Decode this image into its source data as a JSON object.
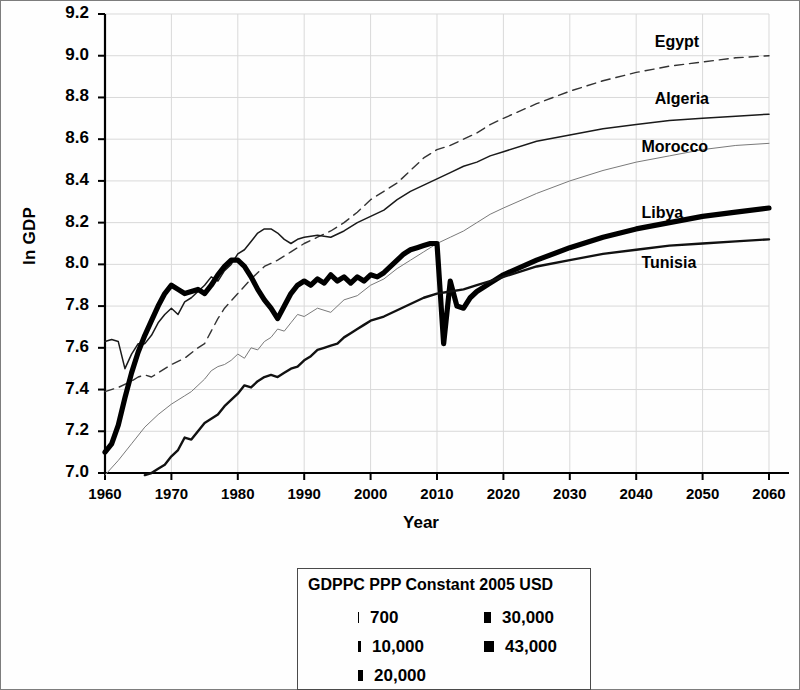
{
  "chart_data": {
    "type": "line",
    "title": "",
    "xlabel": "Year",
    "ylabel": "ln GDP",
    "xlim": [
      1960,
      2060
    ],
    "ylim": [
      7.0,
      9.2
    ],
    "xticks": [
      1960,
      1970,
      1980,
      1990,
      2000,
      2010,
      2020,
      2030,
      2040,
      2050,
      2060
    ],
    "yticks": [
      "7.0",
      "7.2",
      "7.4",
      "7.6",
      "7.8",
      "8.0",
      "8.2",
      "8.4",
      "8.6",
      "8.8",
      "9.0",
      "9.2"
    ],
    "grid": true,
    "legend_position": "below-plot",
    "series": [
      {
        "name": "Egypt",
        "style": "dashed",
        "width": 1.4,
        "color": "#333333",
        "label_x": 2044,
        "label_y": 9.06,
        "x": [
          1960,
          1962,
          1964,
          1965,
          1966,
          1967,
          1968,
          1970,
          1972,
          1974,
          1975,
          1976,
          1977,
          1978,
          1980,
          1982,
          1984,
          1986,
          1988,
          1990,
          1992,
          1994,
          1996,
          1998,
          2000,
          2002,
          2004,
          2006,
          2008,
          2010,
          2012,
          2014,
          2016,
          2018,
          2020,
          2025,
          2030,
          2035,
          2040,
          2045,
          2050,
          2055,
          2060
        ],
        "y": [
          7.39,
          7.41,
          7.44,
          7.46,
          7.47,
          7.46,
          7.48,
          7.52,
          7.55,
          7.6,
          7.62,
          7.68,
          7.74,
          7.79,
          7.86,
          7.93,
          7.99,
          8.02,
          8.06,
          8.1,
          8.13,
          8.16,
          8.2,
          8.25,
          8.31,
          8.35,
          8.39,
          8.45,
          8.51,
          8.55,
          8.57,
          8.6,
          8.63,
          8.67,
          8.7,
          8.77,
          8.83,
          8.88,
          8.92,
          8.95,
          8.97,
          8.99,
          9.0
        ]
      },
      {
        "name": "Algeria",
        "style": "solid",
        "width": 1.5,
        "color": "#1a1a1a",
        "label_x": 2044,
        "label_y": 8.79,
        "x": [
          1960,
          1961,
          1962,
          1963,
          1964,
          1965,
          1966,
          1967,
          1968,
          1969,
          1970,
          1971,
          1972,
          1973,
          1974,
          1975,
          1976,
          1977,
          1978,
          1979,
          1980,
          1981,
          1982,
          1983,
          1984,
          1985,
          1986,
          1987,
          1988,
          1989,
          1990,
          1992,
          1994,
          1996,
          1998,
          2000,
          2002,
          2004,
          2006,
          2008,
          2010,
          2012,
          2014,
          2016,
          2018,
          2020,
          2025,
          2030,
          2035,
          2040,
          2045,
          2050,
          2055,
          2060
        ],
        "y": [
          7.63,
          7.64,
          7.63,
          7.5,
          7.57,
          7.62,
          7.62,
          7.66,
          7.72,
          7.76,
          7.79,
          7.76,
          7.82,
          7.84,
          7.87,
          7.9,
          7.94,
          7.92,
          7.97,
          8.0,
          8.05,
          8.07,
          8.11,
          8.15,
          8.17,
          8.17,
          8.15,
          8.12,
          8.1,
          8.12,
          8.13,
          8.14,
          8.13,
          8.16,
          8.2,
          8.23,
          8.26,
          8.31,
          8.35,
          8.38,
          8.41,
          8.44,
          8.47,
          8.49,
          8.52,
          8.54,
          8.59,
          8.62,
          8.65,
          8.67,
          8.69,
          8.7,
          8.71,
          8.72
        ]
      },
      {
        "name": "Morocco",
        "style": "solid",
        "width": 1.0,
        "color": "#7a7a7a",
        "label_x": 2042,
        "label_y": 8.56,
        "x": [
          1960,
          1962,
          1964,
          1966,
          1968,
          1970,
          1971,
          1972,
          1973,
          1974,
          1975,
          1976,
          1977,
          1978,
          1979,
          1980,
          1981,
          1982,
          1983,
          1984,
          1985,
          1986,
          1987,
          1988,
          1989,
          1990,
          1992,
          1994,
          1996,
          1998,
          2000,
          2002,
          2004,
          2006,
          2008,
          2010,
          2012,
          2014,
          2016,
          2018,
          2020,
          2025,
          2030,
          2035,
          2040,
          2045,
          2050,
          2055,
          2060
        ],
        "y": [
          6.99,
          7.06,
          7.14,
          7.22,
          7.28,
          7.33,
          7.35,
          7.37,
          7.39,
          7.42,
          7.45,
          7.49,
          7.51,
          7.52,
          7.54,
          7.57,
          7.55,
          7.6,
          7.59,
          7.63,
          7.65,
          7.69,
          7.68,
          7.72,
          7.76,
          7.75,
          7.79,
          7.77,
          7.83,
          7.85,
          7.9,
          7.93,
          7.98,
          8.02,
          8.06,
          8.1,
          8.13,
          8.16,
          8.2,
          8.24,
          8.27,
          8.34,
          8.4,
          8.45,
          8.49,
          8.52,
          8.55,
          8.57,
          8.58
        ]
      },
      {
        "name": "Libya",
        "style": "solid",
        "width": 5.2,
        "color": "#000000",
        "label_x": 2042,
        "label_y": 8.24,
        "x": [
          1960,
          1961,
          1962,
          1963,
          1964,
          1965,
          1966,
          1967,
          1968,
          1969,
          1970,
          1971,
          1972,
          1973,
          1974,
          1975,
          1976,
          1977,
          1978,
          1979,
          1980,
          1981,
          1982,
          1983,
          1984,
          1985,
          1986,
          1987,
          1988,
          1989,
          1990,
          1991,
          1992,
          1993,
          1994,
          1995,
          1996,
          1997,
          1998,
          1999,
          2000,
          2001,
          2002,
          2003,
          2004,
          2005,
          2006,
          2007,
          2008,
          2009,
          2010,
          2011,
          2012,
          2013,
          2014,
          2015,
          2016,
          2018,
          2020,
          2025,
          2030,
          2035,
          2040,
          2045,
          2050,
          2055,
          2060
        ],
        "y": [
          7.1,
          7.14,
          7.23,
          7.36,
          7.48,
          7.58,
          7.66,
          7.73,
          7.8,
          7.86,
          7.9,
          7.88,
          7.86,
          7.87,
          7.88,
          7.86,
          7.9,
          7.95,
          7.99,
          8.02,
          8.02,
          7.99,
          7.94,
          7.88,
          7.83,
          7.79,
          7.74,
          7.8,
          7.86,
          7.9,
          7.92,
          7.9,
          7.93,
          7.91,
          7.95,
          7.92,
          7.94,
          7.91,
          7.94,
          7.92,
          7.95,
          7.94,
          7.96,
          7.99,
          8.02,
          8.05,
          8.07,
          8.08,
          8.09,
          8.1,
          8.1,
          7.62,
          7.92,
          7.8,
          7.79,
          7.84,
          7.87,
          7.91,
          7.95,
          8.02,
          8.08,
          8.13,
          8.17,
          8.2,
          8.23,
          8.25,
          8.27
        ]
      },
      {
        "name": "Tunisia",
        "style": "solid",
        "width": 2.4,
        "color": "#111111",
        "label_x": 2042,
        "label_y": 8.0,
        "x": [
          1966,
          1967,
          1968,
          1969,
          1970,
          1971,
          1972,
          1973,
          1974,
          1975,
          1976,
          1977,
          1978,
          1979,
          1980,
          1981,
          1982,
          1983,
          1984,
          1985,
          1986,
          1987,
          1988,
          1989,
          1990,
          1991,
          1992,
          1993,
          1994,
          1995,
          1996,
          1997,
          1998,
          1999,
          2000,
          2002,
          2004,
          2006,
          2008,
          2010,
          2012,
          2014,
          2016,
          2018,
          2020,
          2025,
          2030,
          2035,
          2040,
          2045,
          2050,
          2055,
          2060
        ],
        "y": [
          6.99,
          7.0,
          7.02,
          7.04,
          7.08,
          7.11,
          7.17,
          7.16,
          7.2,
          7.24,
          7.26,
          7.28,
          7.32,
          7.35,
          7.38,
          7.42,
          7.41,
          7.44,
          7.46,
          7.47,
          7.46,
          7.48,
          7.5,
          7.51,
          7.54,
          7.56,
          7.59,
          7.6,
          7.61,
          7.62,
          7.65,
          7.67,
          7.69,
          7.71,
          7.73,
          7.75,
          7.78,
          7.81,
          7.84,
          7.86,
          7.87,
          7.88,
          7.9,
          7.92,
          7.94,
          7.99,
          8.02,
          8.05,
          8.07,
          8.09,
          8.1,
          8.11,
          8.12
        ]
      }
    ]
  },
  "axes": {
    "ylabel": "ln GDP",
    "xlabel": "Year",
    "yticks": [
      "9.2",
      "9.0",
      "8.8",
      "8.6",
      "8.4",
      "8.2",
      "8.0",
      "7.8",
      "7.6",
      "7.4",
      "7.2",
      "7.0"
    ],
    "xticks": [
      "1960",
      "1970",
      "1980",
      "1990",
      "2000",
      "2010",
      "2020",
      "2030",
      "2040",
      "2050",
      "2060"
    ]
  },
  "series_labels": {
    "egypt": "Egypt",
    "algeria": "Algeria",
    "morocco": "Morocco",
    "libya": "Libya",
    "tunisia": "Tunisia"
  },
  "legend": {
    "title": "GDPPC PPP Constant 2005 USD",
    "entries": [
      {
        "label": "700",
        "thickness": 1,
        "column": 0,
        "row": 0
      },
      {
        "label": "10,000",
        "thickness": 3,
        "column": 0,
        "row": 1
      },
      {
        "label": "20,000",
        "thickness": 5,
        "column": 0,
        "row": 2
      },
      {
        "label": "30,000",
        "thickness": 7,
        "column": 1,
        "row": 0
      },
      {
        "label": "43,000",
        "thickness": 10,
        "column": 1,
        "row": 1
      }
    ]
  },
  "colors": {
    "axis": "#000000",
    "grid": "#d9d9d9",
    "frame": "#7d7d7d"
  }
}
